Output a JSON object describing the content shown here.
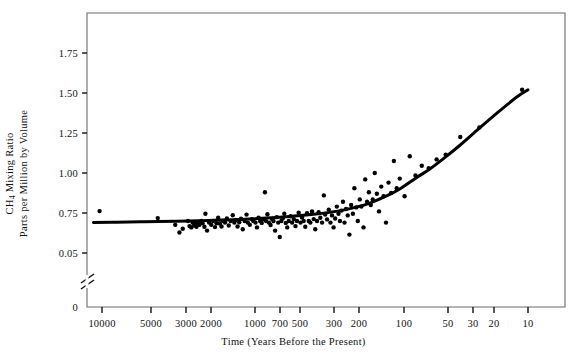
{
  "figure": {
    "background": "#ffffff",
    "ink_color": "#111111",
    "frame": {
      "left": 87,
      "top": 13,
      "right": 565,
      "bottom": 307
    }
  },
  "axes": {
    "x_title": "Time (Years Before the Present)",
    "y_title_line1": "CH",
    "y_title_sub": "4",
    "y_title_line1_rest": " Mixing Ratio",
    "y_title_line2": "Parts per Million by Volume",
    "x_ticks": [
      {
        "label": "10000",
        "x": 102
      },
      {
        "label": "5000",
        "x": 151
      },
      {
        "label": "3000",
        "x": 186
      },
      {
        "label": "2000",
        "x": 211
      },
      {
        "label": "1000",
        "x": 255
      },
      {
        "label": "700",
        "x": 280
      },
      {
        "label": "500",
        "x": 300
      },
      {
        "label": "300",
        "x": 334
      },
      {
        "label": "200",
        "x": 359
      },
      {
        "label": "100",
        "x": 404
      },
      {
        "label": "50",
        "x": 448
      },
      {
        "label": "30",
        "x": 473
      },
      {
        "label": "20",
        "x": 494
      },
      {
        "label": "10",
        "x": 528
      }
    ],
    "y_ticks": [
      {
        "label": "1.75",
        "y": 53
      },
      {
        "label": "1.50",
        "y": 93
      },
      {
        "label": "1.25",
        "y": 133
      },
      {
        "label": "1.00",
        "y": 173
      },
      {
        "label": "0.75",
        "y": 213
      },
      {
        "label": "0.05",
        "y": 253
      },
      {
        "label": "0",
        "y": 307
      }
    ],
    "axis_break": {
      "x": 87,
      "y": 278,
      "note": "broken-axis-slash"
    }
  },
  "chart_data": {
    "type": "scatter",
    "title": "",
    "xlabel": "Time (Years Before the Present)",
    "ylabel": "CH4 Mixing Ratio Parts per Million by Volume",
    "x_scale": "log-reversed",
    "xlim": [
      10000,
      10
    ],
    "ylim": [
      0.05,
      1.95
    ],
    "y_axis_broken_between": [
      0.05,
      0.75
    ],
    "grid": false,
    "legend": null,
    "marker": {
      "shape": "circle",
      "color": "#000000",
      "size_px": 4.4
    },
    "fit_curve": {
      "name": "smoothed trend",
      "color": "#000000",
      "width_px": 3.0,
      "points": [
        {
          "x": 11500,
          "y": 0.69
        },
        {
          "x": 8000,
          "y": 0.692
        },
        {
          "x": 5000,
          "y": 0.695
        },
        {
          "x": 3000,
          "y": 0.699
        },
        {
          "x": 2000,
          "y": 0.702
        },
        {
          "x": 1400,
          "y": 0.706
        },
        {
          "x": 1000,
          "y": 0.711
        },
        {
          "x": 700,
          "y": 0.718
        },
        {
          "x": 500,
          "y": 0.727
        },
        {
          "x": 400,
          "y": 0.734
        },
        {
          "x": 300,
          "y": 0.745
        },
        {
          "x": 250,
          "y": 0.754
        },
        {
          "x": 200,
          "y": 0.768
        },
        {
          "x": 160,
          "y": 0.788
        },
        {
          "x": 130,
          "y": 0.812
        },
        {
          "x": 100,
          "y": 0.855
        },
        {
          "x": 80,
          "y": 0.9
        },
        {
          "x": 60,
          "y": 0.975
        },
        {
          "x": 50,
          "y": 1.02
        },
        {
          "x": 40,
          "y": 1.085
        },
        {
          "x": 30,
          "y": 1.175
        },
        {
          "x": 22,
          "y": 1.28
        },
        {
          "x": 16,
          "y": 1.385
        },
        {
          "x": 12,
          "y": 1.475
        },
        {
          "x": 10,
          "y": 1.52
        }
      ]
    },
    "points": [
      {
        "x": 10400,
        "y": 0.762
      },
      {
        "x": 4050,
        "y": 0.718
      },
      {
        "x": 3050,
        "y": 0.676
      },
      {
        "x": 2850,
        "y": 0.628
      },
      {
        "x": 2700,
        "y": 0.652
      },
      {
        "x": 2480,
        "y": 0.7
      },
      {
        "x": 2420,
        "y": 0.668
      },
      {
        "x": 2350,
        "y": 0.66
      },
      {
        "x": 2300,
        "y": 0.69
      },
      {
        "x": 2250,
        "y": 0.672
      },
      {
        "x": 2200,
        "y": 0.682
      },
      {
        "x": 2160,
        "y": 0.664
      },
      {
        "x": 2100,
        "y": 0.69
      },
      {
        "x": 2060,
        "y": 0.676
      },
      {
        "x": 2000,
        "y": 0.7
      },
      {
        "x": 1960,
        "y": 0.686
      },
      {
        "x": 1900,
        "y": 0.664
      },
      {
        "x": 1870,
        "y": 0.745
      },
      {
        "x": 1820,
        "y": 0.64
      },
      {
        "x": 1760,
        "y": 0.69
      },
      {
        "x": 1700,
        "y": 0.676
      },
      {
        "x": 1650,
        "y": 0.7
      },
      {
        "x": 1600,
        "y": 0.662
      },
      {
        "x": 1560,
        "y": 0.686
      },
      {
        "x": 1520,
        "y": 0.72
      },
      {
        "x": 1480,
        "y": 0.684
      },
      {
        "x": 1440,
        "y": 0.666
      },
      {
        "x": 1400,
        "y": 0.7
      },
      {
        "x": 1360,
        "y": 0.69
      },
      {
        "x": 1320,
        "y": 0.716
      },
      {
        "x": 1280,
        "y": 0.672
      },
      {
        "x": 1240,
        "y": 0.7
      },
      {
        "x": 1200,
        "y": 0.736
      },
      {
        "x": 1170,
        "y": 0.69
      },
      {
        "x": 1140,
        "y": 0.706
      },
      {
        "x": 1110,
        "y": 0.666
      },
      {
        "x": 1080,
        "y": 0.692
      },
      {
        "x": 1050,
        "y": 0.714
      },
      {
        "x": 1020,
        "y": 0.648
      },
      {
        "x": 990,
        "y": 0.7
      },
      {
        "x": 960,
        "y": 0.74
      },
      {
        "x": 940,
        "y": 0.69
      },
      {
        "x": 910,
        "y": 0.676
      },
      {
        "x": 880,
        "y": 0.712
      },
      {
        "x": 860,
        "y": 0.7
      },
      {
        "x": 830,
        "y": 0.69
      },
      {
        "x": 810,
        "y": 0.66
      },
      {
        "x": 790,
        "y": 0.72
      },
      {
        "x": 770,
        "y": 0.7
      },
      {
        "x": 750,
        "y": 0.688
      },
      {
        "x": 730,
        "y": 0.712
      },
      {
        "x": 712,
        "y": 0.88
      },
      {
        "x": 700,
        "y": 0.7
      },
      {
        "x": 684,
        "y": 0.742
      },
      {
        "x": 668,
        "y": 0.69
      },
      {
        "x": 650,
        "y": 0.675
      },
      {
        "x": 634,
        "y": 0.712
      },
      {
        "x": 620,
        "y": 0.7
      },
      {
        "x": 604,
        "y": 0.64
      },
      {
        "x": 588,
        "y": 0.724
      },
      {
        "x": 574,
        "y": 0.69
      },
      {
        "x": 560,
        "y": 0.6
      },
      {
        "x": 546,
        "y": 0.7
      },
      {
        "x": 534,
        "y": 0.716
      },
      {
        "x": 520,
        "y": 0.745
      },
      {
        "x": 508,
        "y": 0.688
      },
      {
        "x": 496,
        "y": 0.66
      },
      {
        "x": 484,
        "y": 0.7
      },
      {
        "x": 470,
        "y": 0.73
      },
      {
        "x": 458,
        "y": 0.69
      },
      {
        "x": 446,
        "y": 0.712
      },
      {
        "x": 434,
        "y": 0.668
      },
      {
        "x": 424,
        "y": 0.7
      },
      {
        "x": 412,
        "y": 0.752
      },
      {
        "x": 400,
        "y": 0.69
      },
      {
        "x": 390,
        "y": 0.722
      },
      {
        "x": 380,
        "y": 0.7
      },
      {
        "x": 370,
        "y": 0.664
      },
      {
        "x": 360,
        "y": 0.748
      },
      {
        "x": 350,
        "y": 0.7
      },
      {
        "x": 341,
        "y": 0.69
      },
      {
        "x": 332,
        "y": 0.76
      },
      {
        "x": 323,
        "y": 0.712
      },
      {
        "x": 315,
        "y": 0.648
      },
      {
        "x": 306,
        "y": 0.7
      },
      {
        "x": 298,
        "y": 0.755
      },
      {
        "x": 290,
        "y": 0.72
      },
      {
        "x": 282,
        "y": 0.69
      },
      {
        "x": 274,
        "y": 0.86
      },
      {
        "x": 268,
        "y": 0.74
      },
      {
        "x": 260,
        "y": 0.71
      },
      {
        "x": 253,
        "y": 0.77
      },
      {
        "x": 246,
        "y": 0.69
      },
      {
        "x": 240,
        "y": 0.735
      },
      {
        "x": 234,
        "y": 0.66
      },
      {
        "x": 228,
        "y": 0.716
      },
      {
        "x": 222,
        "y": 0.79
      },
      {
        "x": 216,
        "y": 0.745
      },
      {
        "x": 211,
        "y": 0.7
      },
      {
        "x": 206,
        "y": 0.765
      },
      {
        "x": 201,
        "y": 0.82
      },
      {
        "x": 196,
        "y": 0.69
      },
      {
        "x": 191,
        "y": 0.775
      },
      {
        "x": 186,
        "y": 0.735
      },
      {
        "x": 181,
        "y": 0.615
      },
      {
        "x": 176,
        "y": 0.8
      },
      {
        "x": 171,
        "y": 0.745
      },
      {
        "x": 167,
        "y": 0.905
      },
      {
        "x": 162,
        "y": 0.785
      },
      {
        "x": 158,
        "y": 0.7
      },
      {
        "x": 153,
        "y": 0.835
      },
      {
        "x": 149,
        "y": 0.79
      },
      {
        "x": 144,
        "y": 0.66
      },
      {
        "x": 140,
        "y": 0.96
      },
      {
        "x": 136,
        "y": 0.82
      },
      {
        "x": 132,
        "y": 0.88
      },
      {
        "x": 128,
        "y": 0.8
      },
      {
        "x": 124,
        "y": 0.835
      },
      {
        "x": 120,
        "y": 1.0
      },
      {
        "x": 116,
        "y": 0.87
      },
      {
        "x": 112,
        "y": 0.76
      },
      {
        "x": 108,
        "y": 0.915
      },
      {
        "x": 104,
        "y": 0.855
      },
      {
        "x": 100,
        "y": 0.69
      },
      {
        "x": 96,
        "y": 0.94
      },
      {
        "x": 92,
        "y": 0.875
      },
      {
        "x": 88,
        "y": 1.075
      },
      {
        "x": 84,
        "y": 0.905
      },
      {
        "x": 80,
        "y": 0.965
      },
      {
        "x": 74,
        "y": 0.855
      },
      {
        "x": 68,
        "y": 1.105
      },
      {
        "x": 62,
        "y": 0.985
      },
      {
        "x": 56,
        "y": 1.045
      },
      {
        "x": 50,
        "y": 1.03
      },
      {
        "x": 44,
        "y": 1.085
      },
      {
        "x": 38,
        "y": 1.115
      },
      {
        "x": 30,
        "y": 1.225
      },
      {
        "x": 22,
        "y": 1.285
      },
      {
        "x": 11,
        "y": 1.52
      }
    ]
  }
}
